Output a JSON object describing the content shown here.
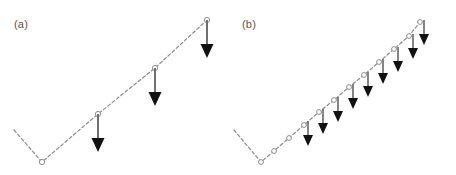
{
  "figure": {
    "width": 456,
    "height": 175,
    "background": "#ffffff",
    "colors": {
      "line": "#8c8c8c",
      "node_stroke": "#8c8c8c",
      "node_fill": "#ffffff",
      "arrow": "#111111",
      "arrow_shaft": "#6f6f6f",
      "label": "#555555"
    }
  },
  "panels": [
    {
      "id": "a",
      "label": "(a)",
      "label_x": 14,
      "label_y": 18,
      "description": "coarse discretization cantilever beam with three point loads",
      "beam": {
        "dashed": true,
        "stroke_width": 1.2,
        "points": [
          {
            "x": 14,
            "y": 130,
            "node": false
          },
          {
            "x": 42,
            "y": 162,
            "node": true
          },
          {
            "x": 98,
            "y": 114,
            "node": true
          },
          {
            "x": 155,
            "y": 68,
            "node": true
          },
          {
            "x": 207,
            "y": 20,
            "node": true
          }
        ]
      },
      "node_radius": 2.6,
      "loads": [
        {
          "x": 98,
          "y": 114,
          "tip_y": 152,
          "head_width": 13,
          "head_height": 14,
          "shaft_width": 2.0
        },
        {
          "x": 155,
          "y": 68,
          "tip_y": 106,
          "head_width": 13,
          "head_height": 14,
          "shaft_width": 2.0
        },
        {
          "x": 207,
          "y": 20,
          "tip_y": 58,
          "head_width": 13,
          "head_height": 14,
          "shaft_width": 2.0
        }
      ]
    },
    {
      "id": "b",
      "label": "(b)",
      "label_x": 14,
      "label_y": 18,
      "description": "fine discretization cantilever beam with eleven point loads",
      "beam": {
        "dashed": true,
        "stroke_width": 1.2,
        "points": [
          {
            "x": 6,
            "y": 130,
            "node": false
          },
          {
            "x": 33,
            "y": 162,
            "node": true
          },
          {
            "x": 46,
            "y": 151,
            "node": true
          },
          {
            "x": 61,
            "y": 138,
            "node": true
          },
          {
            "x": 76,
            "y": 125,
            "node": true
          },
          {
            "x": 91,
            "y": 112,
            "node": true
          },
          {
            "x": 106,
            "y": 100,
            "node": true
          },
          {
            "x": 121,
            "y": 87,
            "node": true
          },
          {
            "x": 136,
            "y": 75,
            "node": true
          },
          {
            "x": 151,
            "y": 62,
            "node": true
          },
          {
            "x": 166,
            "y": 49,
            "node": true
          },
          {
            "x": 181,
            "y": 36,
            "node": true
          },
          {
            "x": 192,
            "y": 22,
            "node": true
          }
        ]
      },
      "node_radius": 2.4,
      "loads": [
        {
          "x": 80,
          "y": 121,
          "tip_y": 146,
          "head_width": 10,
          "head_height": 11,
          "shaft_width": 1.7
        },
        {
          "x": 95,
          "y": 109,
          "tip_y": 134,
          "head_width": 10,
          "head_height": 11,
          "shaft_width": 1.7
        },
        {
          "x": 110,
          "y": 97,
          "tip_y": 122,
          "head_width": 10,
          "head_height": 11,
          "shaft_width": 1.7
        },
        {
          "x": 125,
          "y": 84,
          "tip_y": 109,
          "head_width": 10,
          "head_height": 11,
          "shaft_width": 1.7
        },
        {
          "x": 140,
          "y": 72,
          "tip_y": 97,
          "head_width": 10,
          "head_height": 11,
          "shaft_width": 1.7
        },
        {
          "x": 155,
          "y": 59,
          "tip_y": 84,
          "head_width": 10,
          "head_height": 11,
          "shaft_width": 1.7
        },
        {
          "x": 170,
          "y": 47,
          "tip_y": 72,
          "head_width": 10,
          "head_height": 11,
          "shaft_width": 1.7
        },
        {
          "x": 185,
          "y": 34,
          "tip_y": 59,
          "head_width": 10,
          "head_height": 11,
          "shaft_width": 1.7
        },
        {
          "x": 196,
          "y": 20,
          "tip_y": 45,
          "head_width": 10,
          "head_height": 11,
          "shaft_width": 1.7
        }
      ]
    }
  ]
}
